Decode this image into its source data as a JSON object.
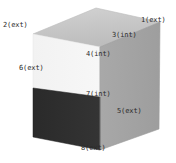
{
  "figure": {
    "type": "3d-box-diagram",
    "background_color": "#ffffff",
    "label_color": "#2b2b2b",
    "faces": [
      {
        "name": "top-face",
        "fill": "#c8c8c8"
      },
      {
        "name": "left-face-upper",
        "fill": "#f4f4f4"
      },
      {
        "name": "left-face-lower",
        "fill": "#2e2e2e"
      },
      {
        "name": "right-face",
        "fill": "#a6a6a6"
      }
    ],
    "labels": [
      {
        "id": "label-1",
        "text": "1(ext)",
        "x": 141,
        "y": 16
      },
      {
        "id": "label-2",
        "text": "2(ext)",
        "x": 3,
        "y": 21
      },
      {
        "id": "label-3",
        "text": "3(int)",
        "x": 112,
        "y": 31
      },
      {
        "id": "label-4",
        "text": "4(int)",
        "x": 86,
        "y": 50
      },
      {
        "id": "label-6",
        "text": "6(ext)",
        "x": 19,
        "y": 64
      },
      {
        "id": "label-7",
        "text": "7(int)",
        "x": 86,
        "y": 90
      },
      {
        "id": "label-5",
        "text": "5(ext)",
        "x": 117,
        "y": 107
      },
      {
        "id": "label-8",
        "text": "8(ext)",
        "x": 81,
        "y": 144
      }
    ]
  }
}
